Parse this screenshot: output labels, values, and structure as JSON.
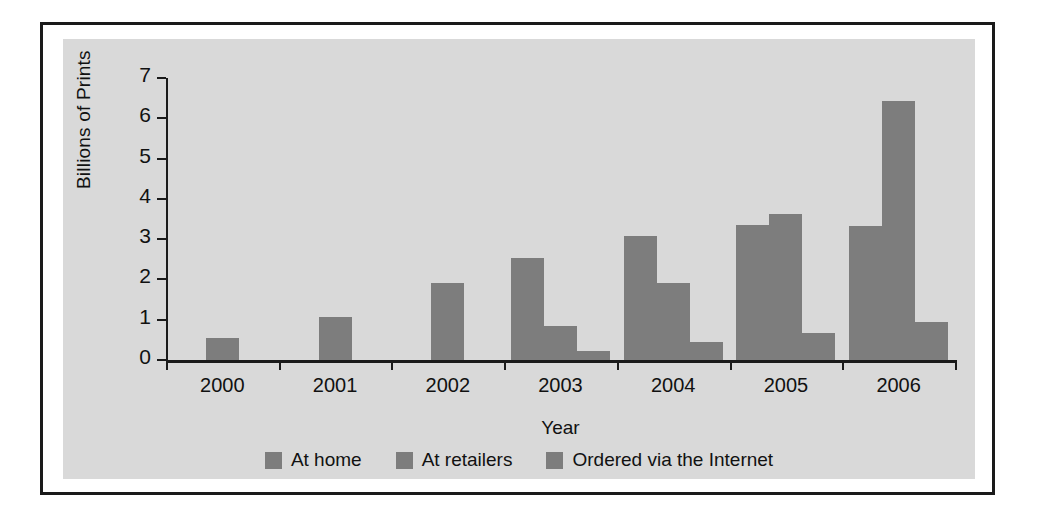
{
  "chart_data": {
    "type": "bar",
    "title": "",
    "xlabel": "Year",
    "ylabel": "Billions of Prints",
    "categories": [
      "2000",
      "2001",
      "2002",
      "2003",
      "2004",
      "2005",
      "2006"
    ],
    "ylim": [
      0,
      7
    ],
    "yticks": [
      0,
      1,
      2,
      3,
      4,
      5,
      6,
      7
    ],
    "ytick_labels": [
      "0",
      "1",
      "2",
      "3",
      "4",
      "5",
      "6",
      "7"
    ],
    "grid": false,
    "legend_position": "bottom",
    "bar_color": "#7d7d7d",
    "panel_color": "#d9d9d9",
    "axis_color": "#1a1a1a",
    "series": [
      {
        "name": "At home",
        "values": [
          0.55,
          1.08,
          1.92,
          2.52,
          3.08,
          3.35,
          3.32
        ]
      },
      {
        "name": "At retailers",
        "values": [
          null,
          null,
          null,
          0.85,
          1.92,
          3.63,
          6.43
        ]
      },
      {
        "name": "Ordered via the Internet",
        "values": [
          null,
          null,
          null,
          0.22,
          0.45,
          0.68,
          0.95
        ]
      }
    ]
  },
  "legend": {
    "items": [
      {
        "label": "At home"
      },
      {
        "label": "At retailers"
      },
      {
        "label": "Ordered via the Internet"
      }
    ]
  }
}
